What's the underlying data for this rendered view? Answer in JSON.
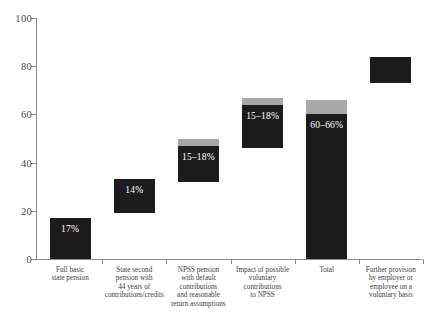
{
  "chart_data": {
    "type": "bar",
    "title": "",
    "subtitle": "",
    "xlabel": "",
    "ylabel": "",
    "ylim": [
      0,
      100
    ],
    "grid": false,
    "legend": "none",
    "waterfall": true,
    "y_ticks": [
      "0",
      "20",
      "40",
      "60",
      "80",
      "100"
    ],
    "y_tick_values": [
      0,
      20,
      40,
      60,
      80,
      100
    ],
    "categories": [
      "Full basic\nstate pension",
      "State second\npension with\n44 years of\ncontributions/credits",
      "NPSS pension\nwith default\ncontributions\nand reasonable\nreturn assumptions",
      "Impact of possible\nvoluntary\ncontributions\nto NPSS",
      "Total",
      "Further provision\nby employer or\nemployee on a\nvoluntary basis"
    ],
    "bars": [
      {
        "name": "full-basic-state-pension",
        "category_lines": [
          "Full basic",
          "state pension"
        ],
        "base": 0,
        "dark_top": 17,
        "grey_top": 17,
        "label": "17%",
        "has_grey_cap": false
      },
      {
        "name": "state-second-pension",
        "category_lines": [
          "State second",
          "pension with",
          "44 years of",
          "contributions/credits"
        ],
        "base": 19,
        "dark_top": 33,
        "grey_top": 33,
        "label": "14%",
        "has_grey_cap": false
      },
      {
        "name": "npss-pension-default",
        "category_lines": [
          "NPSS pension",
          "with default",
          "contributions",
          "and reasonable",
          "return assumptions"
        ],
        "base": 32,
        "dark_top": 47,
        "grey_top": 50,
        "label": "15–18%",
        "has_grey_cap": true
      },
      {
        "name": "impact-voluntary-contributions",
        "category_lines": [
          "Impact of possible",
          "voluntary",
          "contributions",
          "to NPSS"
        ],
        "base": 46,
        "dark_top": 64,
        "grey_top": 67,
        "label": "15–18%",
        "has_grey_cap": true
      },
      {
        "name": "total",
        "category_lines": [
          "Total"
        ],
        "base": 0,
        "dark_top": 60,
        "grey_top": 66,
        "label": "60–66%",
        "has_grey_cap": true
      },
      {
        "name": "further-provision-employer-employee",
        "category_lines": [
          "Further provision",
          "by employer or",
          "employee on a",
          "voluntary basis"
        ],
        "base": 73,
        "dark_top": 84,
        "grey_top": 84,
        "label": "",
        "has_grey_cap": false
      }
    ],
    "colors": {
      "dark": "#1c1c1c",
      "grey": "#a8a8a8",
      "axis": "#8a8a8a",
      "tick_text": "#4a4a4a",
      "category_text": "#3d3d3d",
      "bar_label_text": "#ffffff",
      "background": "#ffffff"
    }
  }
}
